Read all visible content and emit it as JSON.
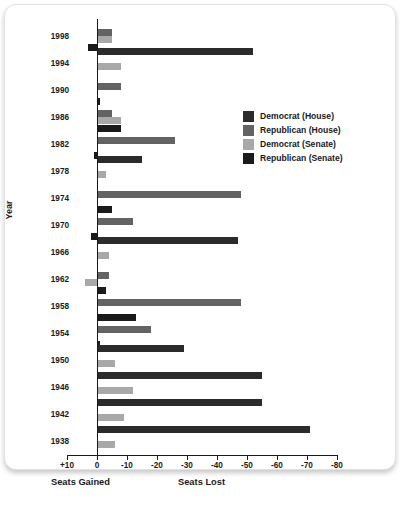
{
  "chart_data": {
    "type": "bar",
    "orientation": "horizontal",
    "title": "",
    "xlabel": "",
    "ylabel": "Year",
    "xlim": [
      10,
      -80
    ],
    "grid": false,
    "legend_position": "inside-right",
    "x_tick_labels": [
      "+10",
      "0",
      "-10",
      "-20",
      "-30",
      "-40",
      "-50",
      "-60",
      "-70",
      "-80"
    ],
    "x_tick_values": [
      10,
      0,
      -10,
      -20,
      -30,
      -40,
      -50,
      -60,
      -70,
      -80
    ],
    "axis_caption_left": "Seats Gained",
    "axis_caption_right": "Seats Lost",
    "categories": [
      "1998",
      "1994",
      "1990",
      "1986",
      "1982",
      "1978",
      "1974",
      "1970",
      "1966",
      "1962",
      "1958",
      "1954",
      "1950",
      "1946",
      "1942",
      "1938"
    ],
    "series": [
      {
        "name": "Democrat (House)",
        "color": "#2b2b2b",
        "values": [
          0,
          -52,
          0,
          0,
          0,
          -15,
          0,
          0,
          -47,
          0,
          0,
          0,
          -29,
          -55,
          -55,
          -71
        ]
      },
      {
        "name": "Republican (House)",
        "color": "#636363",
        "values": [
          -5,
          0,
          -8,
          -5,
          -26,
          0,
          -48,
          -12,
          0,
          -4,
          -48,
          -18,
          0,
          0,
          0,
          0
        ]
      },
      {
        "name": "Democrat (Senate)",
        "color": "#a8a8a8",
        "values": [
          -5,
          -8,
          0,
          -8,
          0,
          -3,
          0,
          0,
          -4,
          4,
          0,
          0,
          -6,
          -12,
          -9,
          -6
        ]
      },
      {
        "name": "Republican (Senate)",
        "color": "#1a1a1a",
        "values": [
          3,
          0,
          -1,
          -8,
          1,
          0,
          -5,
          2,
          0,
          -3,
          -13,
          -1,
          0,
          0,
          0,
          0
        ]
      }
    ]
  },
  "legend": {
    "entries": [
      {
        "label": "Democrat (House)",
        "color": "#2b2b2b"
      },
      {
        "label": "Republican (House)",
        "color": "#636363"
      },
      {
        "label": "Democrat (Senate)",
        "color": "#a8a8a8"
      },
      {
        "label": "Republican (Senate)",
        "color": "#1a1a1a"
      }
    ]
  }
}
